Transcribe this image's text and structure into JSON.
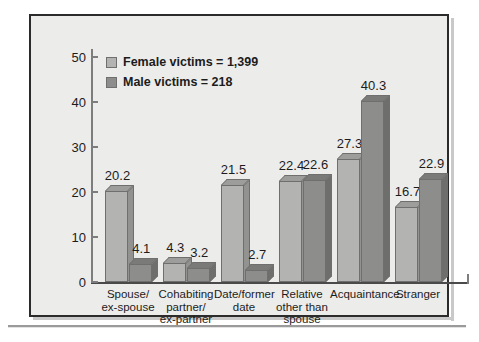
{
  "chart_data": {
    "type": "bar",
    "title": "",
    "subtitle": "",
    "xlabel": "",
    "ylabel": "",
    "ylim": [
      0,
      50
    ],
    "yticks": [
      0,
      10,
      20,
      30,
      40,
      50
    ],
    "ytick_labels": [
      "0",
      "10",
      "20",
      "30",
      "40",
      "50"
    ],
    "grid": false,
    "legend_position": "top-left",
    "categories": [
      "Spouse/\nex-spouse",
      "Cohabiting\npartner/\nex-partner",
      "Date/former\ndate",
      "Relative\nother than\nspouse",
      "Acquaintance",
      "Stranger"
    ],
    "series": [
      {
        "name": "Female victims = 1,399",
        "key": "female",
        "color": "#b3b3b1",
        "values": [
          20.2,
          4.3,
          21.5,
          22.4,
          27.3,
          16.7
        ],
        "value_labels": [
          "20.2",
          "4.3",
          "21.5",
          "22.4",
          "27.3",
          "16.7"
        ]
      },
      {
        "name": "Male victims = 218",
        "key": "male",
        "color": "#8d8d8b",
        "values": [
          4.1,
          3.2,
          2.7,
          22.6,
          40.3,
          22.9
        ],
        "value_labels": [
          "4.1",
          "3.2",
          "2.7",
          "22.6",
          "40.3",
          "22.9"
        ]
      }
    ]
  },
  "legend": {
    "items": [
      {
        "label": "Female victims = 1,399",
        "swatch": "female"
      },
      {
        "label": "Male victims = 218",
        "swatch": "male"
      }
    ]
  },
  "colors": {
    "frame_border": "#2b2b2b",
    "frame_background": "#ececeb",
    "female_bar": "#b3b3b1",
    "male_bar": "#8d8d8b",
    "axis": "#4a4a4a",
    "text": "#1c1c1c"
  }
}
